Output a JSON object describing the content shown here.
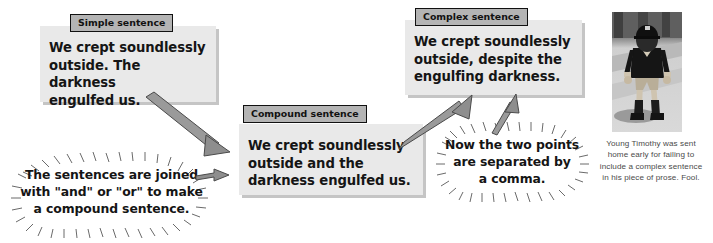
{
  "page": {
    "background": "#ffffff",
    "box_fill": "#e9e9e9",
    "tag_fill": "#b4b4b4",
    "arrow_fill": "#8f8f8f",
    "text_color": "#151515"
  },
  "boxes": [
    {
      "id": "simple",
      "tag": "Simple sentence",
      "text": "We crept soundlessly\noutside.  The darkness\nengulfed us."
    },
    {
      "id": "compound",
      "tag": "Compound sentence",
      "text": "We crept soundlessly\noutside and the\ndarkness engulfed us."
    },
    {
      "id": "complex",
      "tag": "Complex sentence",
      "text": "We crept soundlessly\noutside, despite the\nengulfing darkness."
    }
  ],
  "callouts": [
    {
      "id": "left",
      "text": "The sentences are joined\nwith \"and\" or \"or\" to make\na compound sentence."
    },
    {
      "id": "right",
      "text": "Now the two points\nare separated by\na comma."
    }
  ],
  "arrows": [
    {
      "id": "simple-to-compound",
      "from": "simple",
      "to": "compound"
    },
    {
      "id": "callout-left-to-compound",
      "from": "callout-left",
      "to": "compound"
    },
    {
      "id": "compound-to-complex",
      "from": "compound",
      "to": "complex"
    },
    {
      "id": "callout-right-to-complex",
      "from": "callout-right",
      "to": "complex"
    }
  ],
  "photo": {
    "alt": "black-and-white photo of a young boy in sports kit standing on a path",
    "caption": "Young Timothy was sent\nhome early for failing to\ninclude a complex sentence\nin his piece of prose.  Fool."
  }
}
